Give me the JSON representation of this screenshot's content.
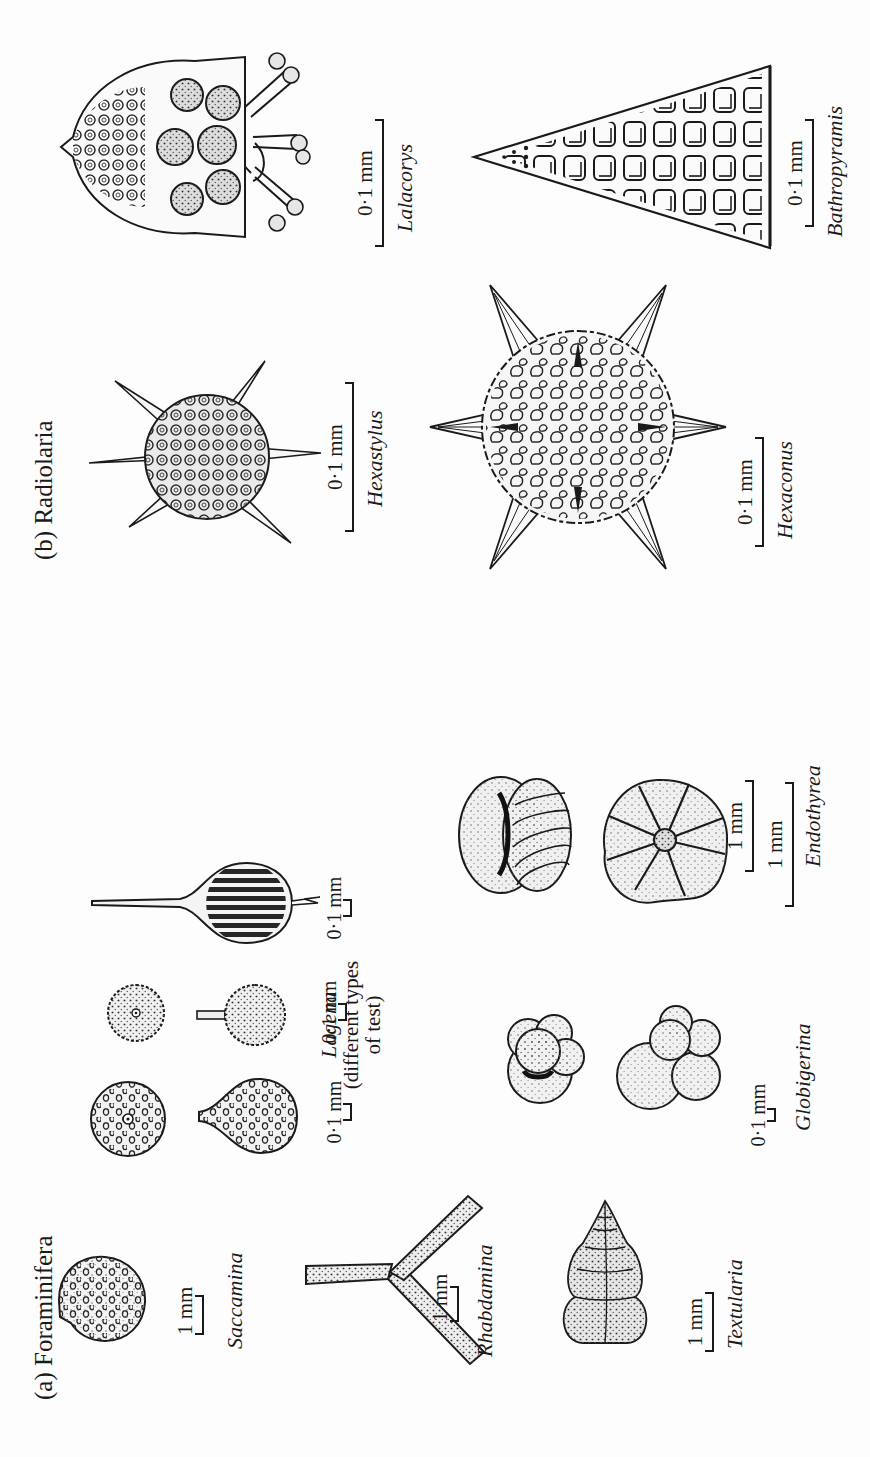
{
  "figure": {
    "orientation": "rotated 90 degrees counter-clockwise (landscape figure on portrait page)",
    "background": "#fdfdfd",
    "ink_color": "#1a1a1a"
  },
  "sections": {
    "foraminifera": {
      "title": "(a) Foraminifera",
      "specimens": {
        "saccamina": {
          "name": "Saccamina",
          "scale": "1 mm"
        },
        "rhabdamina": {
          "name": "Rhabdamina",
          "scale": "1 mm"
        },
        "textularia": {
          "name": "Textularia",
          "scale": "1 mm"
        },
        "lagena": {
          "name": "Lagena",
          "note_line1": "(different types",
          "note_line2": "of test)",
          "scale_1": "0·1 mm",
          "scale_2": "0·1 mm",
          "scale_3": "0·1 mm"
        },
        "globigerina": {
          "name": "Globigerina",
          "scale": "0·1 mm"
        },
        "endothyrea": {
          "name": "Endothyrea",
          "scale_1": "1 mm",
          "scale_2": "1 mm"
        }
      }
    },
    "radiolaria": {
      "title": "(b) Radiolaria",
      "specimens": {
        "hexastylus": {
          "name": "Hexastylus",
          "scale": "0·1 mm"
        },
        "hexaconus": {
          "name": "Hexaconus",
          "scale": "0·1 mm"
        },
        "lalacorys": {
          "name": "Lalacorys",
          "scale": "0·1 mm"
        },
        "bathropyramis": {
          "name": "Bathropyramis",
          "scale": "0·1 mm"
        }
      }
    }
  }
}
